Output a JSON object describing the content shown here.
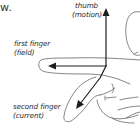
{
  "diagram": {
    "title_fragment": "w.",
    "labels": {
      "thumb": {
        "line1": "thumb",
        "line2": "(motion)"
      },
      "first_finger": {
        "line1": "first finger",
        "line2": "(field)"
      },
      "second_finger": {
        "line1": "second finger",
        "line2": "(current)"
      }
    },
    "arrows": [
      {
        "name": "thumb",
        "direction": "up",
        "meaning": "motion"
      },
      {
        "name": "first finger",
        "direction": "left",
        "meaning": "field"
      },
      {
        "name": "second finger",
        "direction": "down-left",
        "meaning": "current"
      }
    ],
    "colors": {
      "stroke": "#222222",
      "outline": "#555555",
      "text": "#2a2a2a"
    }
  }
}
